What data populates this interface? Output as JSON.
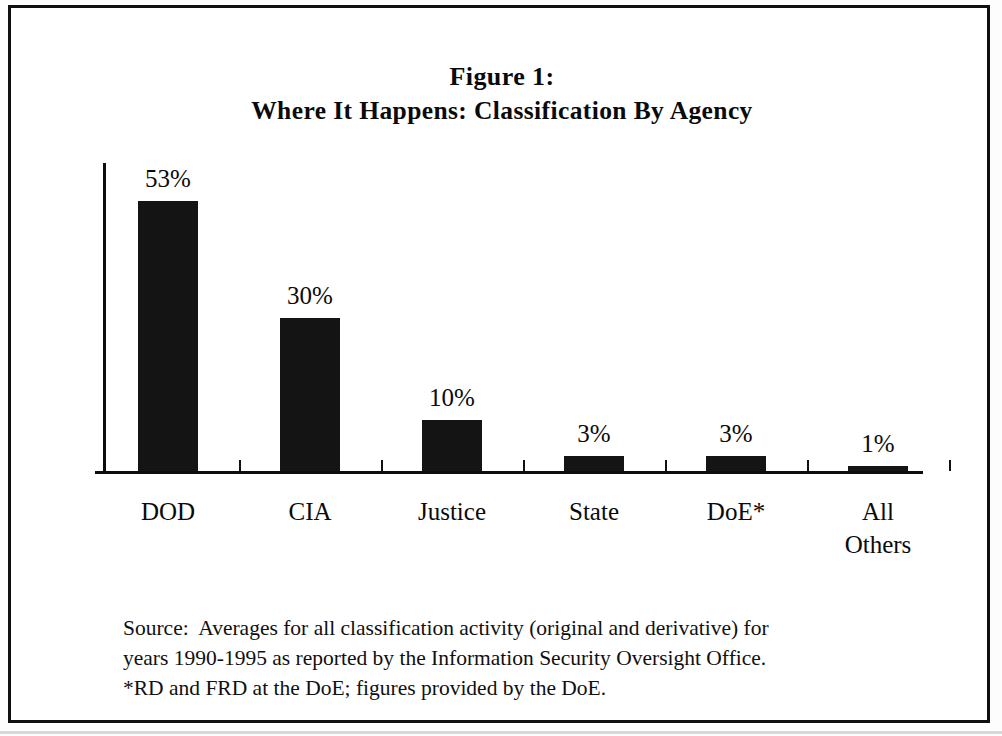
{
  "figure": {
    "title_line1": "Figure 1:",
    "title_line2": "Where It Happens:  Classification By Agency"
  },
  "chart_data": {
    "type": "bar",
    "title": "Figure 1: Where It Happens:  Classification By Agency",
    "xlabel": "",
    "ylabel": "",
    "ylim": [
      0,
      53
    ],
    "grid": false,
    "legend": "none",
    "categories": [
      "DOD",
      "CIA",
      "Justice",
      "State",
      "DoE*",
      "All Others"
    ],
    "values": [
      53,
      30,
      10,
      3,
      3,
      1
    ],
    "value_labels": [
      "53%",
      "30%",
      "10%",
      "3%",
      "3%",
      "1%"
    ],
    "bar_color": "#141414",
    "axis_color": "#0d0d0d"
  },
  "categories_display": [
    {
      "line1": "DOD",
      "line2": ""
    },
    {
      "line1": "CIA",
      "line2": ""
    },
    {
      "line1": "Justice",
      "line2": ""
    },
    {
      "line1": "State",
      "line2": ""
    },
    {
      "line1": "DoE*",
      "line2": ""
    },
    {
      "line1": "All",
      "line2": "Others"
    }
  ],
  "source": {
    "line1": "Source:  Averages for all classification activity (original and derivative) for",
    "line2": "years 1990-1995 as reported by the Information Security Oversight Office.",
    "line3": "*RD and FRD at the DoE; figures provided by the DoE."
  }
}
